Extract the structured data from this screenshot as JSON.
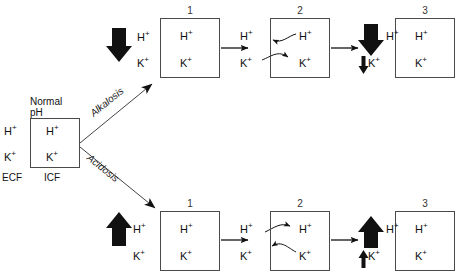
{
  "diagram": {
    "title_absent": true,
    "ion_h": "H",
    "ion_h_sup": "+",
    "ion_k": "K",
    "ion_k_sup": "+",
    "colors": {
      "stroke": "#4a4a4a",
      "arrow": "#111111",
      "text": "#111111"
    }
  },
  "origin_box": {
    "label_line1": "Normal",
    "label_line2": "pH",
    "outside_h": "H+",
    "outside_k": "K+",
    "inside_h": "H+",
    "inside_k": "K+",
    "compartment_outside": "ECF",
    "compartment_inside": "ICF"
  },
  "branches": [
    {
      "name": "alkalosis",
      "label": "Alkalosis",
      "direction": "up"
    },
    {
      "name": "acidosis",
      "label": "Acidosis",
      "direction": "down"
    }
  ],
  "rows": [
    {
      "name": "alkalosis-row",
      "branch_label": "Alkalosis",
      "stages": [
        {
          "number": "1",
          "outside_h": "H+",
          "outside_k": "K+",
          "inside_h": "H+",
          "inside_k": "K+",
          "h_change": "decrease-large",
          "k_change": "none"
        },
        {
          "number": "2",
          "outside_h": "H+",
          "outside_k": "K+",
          "inside_h": "H+",
          "inside_k": "K+",
          "exchange": "H+ moves out of cell, K+ moves into cell"
        },
        {
          "number": "3",
          "outside_h": "H+",
          "outside_k": "K+",
          "inside_h": "H+",
          "inside_k": "K+",
          "h_change": "decrease-large",
          "k_change": "decrease-small"
        }
      ]
    },
    {
      "name": "acidosis-row",
      "branch_label": "Acidosis",
      "stages": [
        {
          "number": "1",
          "outside_h": "H+",
          "outside_k": "K+",
          "inside_h": "H+",
          "inside_k": "K+",
          "h_change": "increase-large",
          "k_change": "none"
        },
        {
          "number": "2",
          "outside_h": "H+",
          "outside_k": "K+",
          "inside_h": "H+",
          "inside_k": "K+",
          "exchange": "H+ moves into cell, K+ moves out of cell"
        },
        {
          "number": "3",
          "outside_h": "H+",
          "outside_k": "K+",
          "inside_h": "H+",
          "inside_k": "K+",
          "h_change": "increase-large",
          "k_change": "increase-small"
        }
      ]
    }
  ]
}
